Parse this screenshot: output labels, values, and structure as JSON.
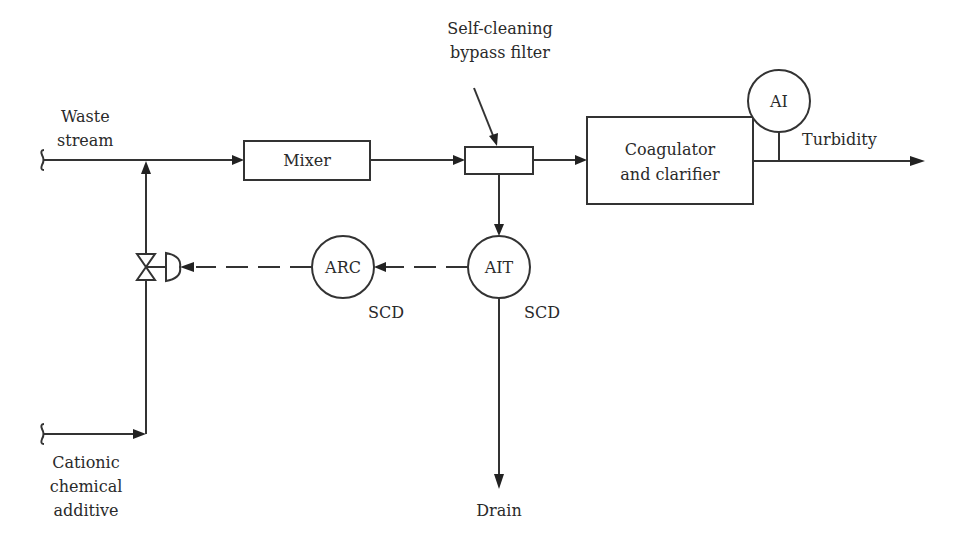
{
  "diagram": {
    "type": "process-control-flow-diagram",
    "colors": {
      "line": "#333333",
      "text": "#2a2a2a",
      "background": "#ffffff"
    },
    "inputs": {
      "waste_stream": {
        "line1": "Waste",
        "line2": "stream"
      },
      "cationic_additive": {
        "line1": "Cationic",
        "line2": "chemical",
        "line3": "additive"
      }
    },
    "equipment": {
      "mixer": {
        "label": "Mixer"
      },
      "filter": {
        "line1": "Self-cleaning",
        "line2": "bypass filter"
      },
      "coagulator": {
        "line1": "Coagulator",
        "line2": "and clarifier"
      }
    },
    "instruments": {
      "ai": {
        "tag": "AI"
      },
      "ait": {
        "tag": "AIT",
        "note": "SCD"
      },
      "arc": {
        "tag": "ARC",
        "note": "SCD"
      }
    },
    "outputs": {
      "turbidity": {
        "label": "Turbidity"
      },
      "drain": {
        "label": "Drain"
      }
    },
    "components": {
      "control_valve": {
        "symbol": "diaphragm-actuated valve"
      }
    },
    "connections": [
      {
        "from": "waste_stream",
        "to": "mixer",
        "type": "process"
      },
      {
        "from": "cationic_additive",
        "to": "waste_stream",
        "type": "process",
        "via": "control_valve"
      },
      {
        "from": "mixer",
        "to": "filter",
        "type": "process"
      },
      {
        "from": "filter",
        "to": "coagulator",
        "type": "process"
      },
      {
        "from": "filter",
        "to": "ait",
        "type": "process"
      },
      {
        "from": "ait",
        "to": "drain",
        "type": "process"
      },
      {
        "from": "ait",
        "to": "arc",
        "type": "signal"
      },
      {
        "from": "arc",
        "to": "control_valve",
        "type": "signal"
      },
      {
        "from": "coagulator",
        "to": "turbidity",
        "type": "process"
      },
      {
        "from": "ai",
        "to": "turbidity",
        "type": "measurement"
      }
    ]
  }
}
